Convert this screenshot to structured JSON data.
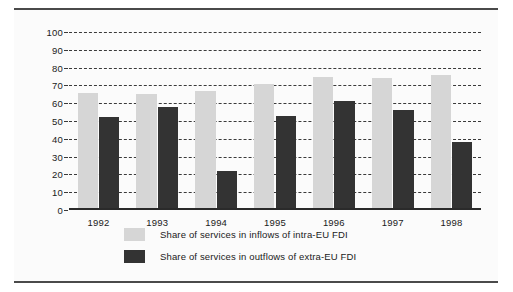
{
  "chart_data": {
    "type": "bar",
    "title": "",
    "subtitle": "",
    "xlabel": "",
    "ylabel": "",
    "categories": [
      "1992",
      "1993",
      "1994",
      "1995",
      "1996",
      "1997",
      "1998"
    ],
    "series": [
      {
        "name": "Share of services in inflows of intra-EU FDI",
        "color": "#d6d6d6",
        "values": [
          66,
          65,
          67,
          71,
          75,
          74,
          76
        ]
      },
      {
        "name": "Share of services in outflows of extra-EU FDI",
        "color": "#333333",
        "values": [
          52,
          58,
          22,
          53,
          61,
          56,
          38
        ]
      }
    ],
    "ylim": [
      0,
      100
    ],
    "ytick_labels": [
      "100",
      "90",
      "80",
      "70",
      "60",
      "50",
      "40",
      "30",
      "20",
      "10",
      "0"
    ],
    "ytick_values": [
      100,
      90,
      80,
      70,
      60,
      50,
      40,
      30,
      20,
      10,
      0
    ],
    "ytick_step": 10,
    "grid": true,
    "grid_style": "dashed-horizontal",
    "legend_position": "bottom-left",
    "legend": [
      "Share of services in inflows of intra-EU FDI",
      "Share of services in outflows of extra-EU FDI"
    ]
  },
  "colors": {
    "series_light": "#d6d6d6",
    "series_dark": "#333333",
    "grid": "#3a3a3a",
    "axis": "#2a2a2a",
    "frame": "#4a4a4a",
    "text": "#1a1a1a",
    "background": "#fbfbfb"
  }
}
